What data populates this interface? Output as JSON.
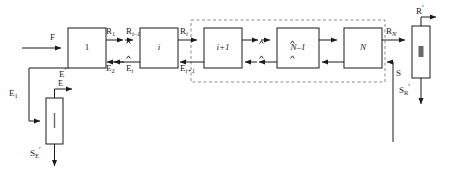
{
  "diagram": {
    "stroke_color": "#1a1a1a",
    "dashed_color": "#808080",
    "box_fill": "#ffffff",
    "boxes": [
      {
        "id": "stage-1",
        "label": "1",
        "style": "upright"
      },
      {
        "id": "stage-i",
        "label": "i",
        "style": "italic"
      },
      {
        "id": "stage-i1",
        "label": "i+1",
        "style": "italic"
      },
      {
        "id": "stage-nm1",
        "label": "N–1",
        "style": "italic"
      },
      {
        "id": "stage-n",
        "label": "N",
        "style": "italic"
      },
      {
        "id": "column-ii",
        "label": "II",
        "style": "upright"
      },
      {
        "id": "column-i",
        "label": "I",
        "style": "upright"
      }
    ],
    "stream_labels": {
      "feed": "F",
      "top_r1": "R",
      "top_r1_sub": "1",
      "top_rim1": "R",
      "top_rim1_sub": "i–1",
      "top_ri": "R",
      "top_ri_sub": "i",
      "top_rn": "R",
      "top_rn_sub": "N",
      "bot_e2": "E",
      "bot_e2_sub": "2",
      "bot_ei": "E",
      "bot_ei_sub": "i",
      "bot_ei1": "E",
      "bot_ei1_sub": "i+1",
      "e_prime": "E",
      "e_prime_sup": "′",
      "e1": "E",
      "e1_sub": "1",
      "e_top_out": "E",
      "r_prime": "R",
      "r_prime_sup": "′",
      "s_feed": "S",
      "s_r_prime": "S",
      "s_r_prime_sub": "R",
      "s_r_prime_sup": "′",
      "s_e_prime": "S",
      "s_e_prime_sub": "E",
      "s_e_prime_sup": "′"
    },
    "break_marks": [
      {
        "id": "break-top-1"
      },
      {
        "id": "break-bot-1"
      },
      {
        "id": "break-top-2"
      },
      {
        "id": "break-bot-2"
      }
    ]
  }
}
